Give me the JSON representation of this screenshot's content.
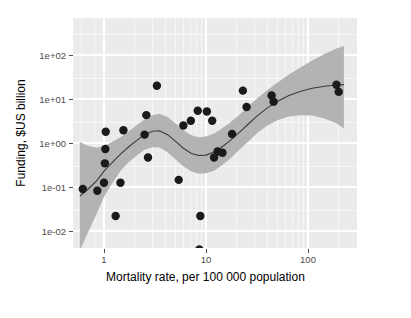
{
  "chart_data": {
    "type": "scatter",
    "title": "",
    "subtitle": "",
    "xlabel": "Mortality rate, per 100 000 population",
    "ylabel": "Funding, $US billion",
    "xscale": "log",
    "yscale": "log",
    "xlim": [
      0.55,
      240
    ],
    "ylim": [
      0.003,
      160
    ],
    "grid": true,
    "legend": null,
    "xticks": [
      1,
      10,
      100
    ],
    "xtick_labels": [
      "1",
      "10",
      "100"
    ],
    "yticks": [
      0.01,
      0.1,
      1,
      10,
      100
    ],
    "ytick_labels": [
      "1e-02",
      "1e-01",
      "1e+00",
      "1e+01",
      "1e+02"
    ],
    "x_minor_ticks": [
      0.6,
      0.8,
      2,
      3,
      4,
      5,
      6,
      7,
      8,
      9,
      20,
      30,
      40,
      50,
      60,
      70,
      80,
      90,
      200
    ],
    "point_color": "#1a1a1a",
    "point_size": 4.2,
    "ribbon_color": "#b3b3b3",
    "line_color": "#3b3b3b",
    "panel_color": "#ebebeb",
    "points": [
      {
        "x": 0.62,
        "y": 0.09
      },
      {
        "x": 0.86,
        "y": 0.082
      },
      {
        "x": 1.0,
        "y": 0.125
      },
      {
        "x": 1.02,
        "y": 0.345
      },
      {
        "x": 1.03,
        "y": 0.73
      },
      {
        "x": 1.04,
        "y": 1.8
      },
      {
        "x": 1.3,
        "y": 0.022
      },
      {
        "x": 1.45,
        "y": 0.125
      },
      {
        "x": 1.55,
        "y": 1.95
      },
      {
        "x": 2.5,
        "y": 1.55
      },
      {
        "x": 2.6,
        "y": 4.3
      },
      {
        "x": 2.7,
        "y": 0.47
      },
      {
        "x": 3.3,
        "y": 20.0
      },
      {
        "x": 5.4,
        "y": 0.145
      },
      {
        "x": 6.0,
        "y": 2.5
      },
      {
        "x": 7.1,
        "y": 3.2
      },
      {
        "x": 8.3,
        "y": 5.4
      },
      {
        "x": 8.6,
        "y": 0.0038
      },
      {
        "x": 8.8,
        "y": 0.022
      },
      {
        "x": 10.2,
        "y": 5.2
      },
      {
        "x": 11.5,
        "y": 3.2
      },
      {
        "x": 12.0,
        "y": 0.47
      },
      {
        "x": 13.0,
        "y": 0.64
      },
      {
        "x": 14.5,
        "y": 0.6
      },
      {
        "x": 18.0,
        "y": 1.6
      },
      {
        "x": 23.0,
        "y": 15.5
      },
      {
        "x": 25.0,
        "y": 6.6
      },
      {
        "x": 44.0,
        "y": 12.0
      },
      {
        "x": 46.0,
        "y": 8.7
      },
      {
        "x": 190.0,
        "y": 21.0
      },
      {
        "x": 200.0,
        "y": 14.5
      }
    ],
    "smooth_line": [
      {
        "x": 0.58,
        "y": 0.062
      },
      {
        "x": 0.7,
        "y": 0.09
      },
      {
        "x": 0.85,
        "y": 0.14
      },
      {
        "x": 1.0,
        "y": 0.23
      },
      {
        "x": 1.2,
        "y": 0.36
      },
      {
        "x": 1.45,
        "y": 0.56
      },
      {
        "x": 1.75,
        "y": 0.82
      },
      {
        "x": 2.1,
        "y": 1.15
      },
      {
        "x": 2.5,
        "y": 1.55
      },
      {
        "x": 3.0,
        "y": 1.85
      },
      {
        "x": 3.5,
        "y": 1.9
      },
      {
        "x": 4.2,
        "y": 1.55
      },
      {
        "x": 5.0,
        "y": 1.1
      },
      {
        "x": 6.0,
        "y": 0.76
      },
      {
        "x": 7.2,
        "y": 0.58
      },
      {
        "x": 8.5,
        "y": 0.52
      },
      {
        "x": 10.0,
        "y": 0.53
      },
      {
        "x": 12.0,
        "y": 0.62
      },
      {
        "x": 14.0,
        "y": 0.78
      },
      {
        "x": 17.0,
        "y": 1.1
      },
      {
        "x": 21.0,
        "y": 1.7
      },
      {
        "x": 26.0,
        "y": 2.7
      },
      {
        "x": 32.0,
        "y": 4.2
      },
      {
        "x": 40.0,
        "y": 6.3
      },
      {
        "x": 50.0,
        "y": 8.8
      },
      {
        "x": 65.0,
        "y": 12.0
      },
      {
        "x": 85.0,
        "y": 15.0
      },
      {
        "x": 110.0,
        "y": 17.5
      },
      {
        "x": 145.0,
        "y": 19.5
      },
      {
        "x": 190.0,
        "y": 20.8
      },
      {
        "x": 225.0,
        "y": 21.2
      }
    ],
    "ribbon_upper": [
      {
        "x": 0.58,
        "y": 1.05
      },
      {
        "x": 0.7,
        "y": 0.85
      },
      {
        "x": 0.85,
        "y": 0.78
      },
      {
        "x": 1.0,
        "y": 0.85
      },
      {
        "x": 1.2,
        "y": 1.05
      },
      {
        "x": 1.45,
        "y": 1.35
      },
      {
        "x": 1.75,
        "y": 1.85
      },
      {
        "x": 2.1,
        "y": 2.55
      },
      {
        "x": 2.5,
        "y": 3.4
      },
      {
        "x": 3.0,
        "y": 4.3
      },
      {
        "x": 3.5,
        "y": 4.6
      },
      {
        "x": 4.2,
        "y": 3.9
      },
      {
        "x": 5.0,
        "y": 2.8
      },
      {
        "x": 6.0,
        "y": 1.95
      },
      {
        "x": 7.2,
        "y": 1.5
      },
      {
        "x": 8.5,
        "y": 1.35
      },
      {
        "x": 10.0,
        "y": 1.4
      },
      {
        "x": 12.0,
        "y": 1.65
      },
      {
        "x": 14.0,
        "y": 2.05
      },
      {
        "x": 17.0,
        "y": 2.85
      },
      {
        "x": 21.0,
        "y": 4.3
      },
      {
        "x": 26.0,
        "y": 6.8
      },
      {
        "x": 32.0,
        "y": 10.5
      },
      {
        "x": 40.0,
        "y": 16.0
      },
      {
        "x": 50.0,
        "y": 23.5
      },
      {
        "x": 65.0,
        "y": 36.0
      },
      {
        "x": 85.0,
        "y": 53.0
      },
      {
        "x": 110.0,
        "y": 75.0
      },
      {
        "x": 145.0,
        "y": 105.0
      },
      {
        "x": 190.0,
        "y": 140.0
      },
      {
        "x": 225.0,
        "y": 160.0
      }
    ],
    "ribbon_lower": [
      {
        "x": 0.58,
        "y": 0.0036
      },
      {
        "x": 0.7,
        "y": 0.0095
      },
      {
        "x": 0.85,
        "y": 0.025
      },
      {
        "x": 1.0,
        "y": 0.06
      },
      {
        "x": 1.2,
        "y": 0.12
      },
      {
        "x": 1.45,
        "y": 0.23
      },
      {
        "x": 1.75,
        "y": 0.37
      },
      {
        "x": 2.1,
        "y": 0.52
      },
      {
        "x": 2.5,
        "y": 0.7
      },
      {
        "x": 3.0,
        "y": 0.8
      },
      {
        "x": 3.5,
        "y": 0.79
      },
      {
        "x": 4.2,
        "y": 0.62
      },
      {
        "x": 5.0,
        "y": 0.43
      },
      {
        "x": 6.0,
        "y": 0.295
      },
      {
        "x": 7.2,
        "y": 0.225
      },
      {
        "x": 8.5,
        "y": 0.2
      },
      {
        "x": 10.0,
        "y": 0.205
      },
      {
        "x": 12.0,
        "y": 0.235
      },
      {
        "x": 14.0,
        "y": 0.3
      },
      {
        "x": 17.0,
        "y": 0.43
      },
      {
        "x": 21.0,
        "y": 0.68
      },
      {
        "x": 26.0,
        "y": 1.08
      },
      {
        "x": 32.0,
        "y": 1.7
      },
      {
        "x": 40.0,
        "y": 2.5
      },
      {
        "x": 50.0,
        "y": 3.3
      },
      {
        "x": 65.0,
        "y": 4.0
      },
      {
        "x": 85.0,
        "y": 4.3
      },
      {
        "x": 110.0,
        "y": 4.2
      },
      {
        "x": 145.0,
        "y": 3.6
      },
      {
        "x": 190.0,
        "y": 2.8
      },
      {
        "x": 225.0,
        "y": 2.1
      }
    ]
  }
}
